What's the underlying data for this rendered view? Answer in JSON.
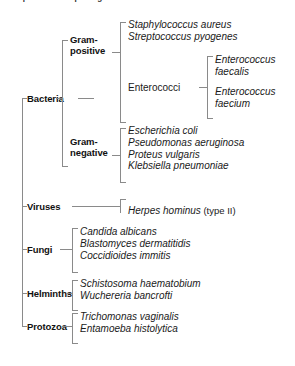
{
  "figure": {
    "clipped_caption_fragment": "Representative pathogens",
    "kingdoms": [
      {
        "label": "Bacteria",
        "subgroups": [
          {
            "label": "Gram-positive",
            "label_line1": "Gram-",
            "label_line2": "positive",
            "organisms": [
              "Staphylococcus aureus",
              "Streptococcus pyogenes"
            ],
            "subgroup2": {
              "label": "Enterococci",
              "organisms": [
                "Enterococcus faecalis",
                "Enterococcus faecium"
              ]
            }
          },
          {
            "label": "Gram-negative",
            "label_line1": "Gram-",
            "label_line2": "negative",
            "organisms": [
              "Escherichia coli",
              "Pseudomonas aeruginosa",
              "Proteus vulgaris",
              "Klebsiella pneumoniae"
            ]
          }
        ]
      },
      {
        "label": "Viruses",
        "organisms": [
          {
            "name": "Herpes hominus",
            "suffix": " (type II)"
          }
        ]
      },
      {
        "label": "Fungi",
        "organisms": [
          "Candida albicans",
          "Blastomyces dermatitidis",
          "Coccidioides immitis"
        ]
      },
      {
        "label": "Helminths",
        "organisms": [
          "Schistosoma haematobium",
          "Wuchereria bancrofti"
        ]
      },
      {
        "label": "Protozoa",
        "organisms": [
          "Trichomonas vaginalis",
          "Entamoeba histolytica"
        ]
      }
    ]
  },
  "style": {
    "background_color": "#ffffff",
    "line_color": "#8a8a8a",
    "text_color": "#1a1a1a"
  }
}
